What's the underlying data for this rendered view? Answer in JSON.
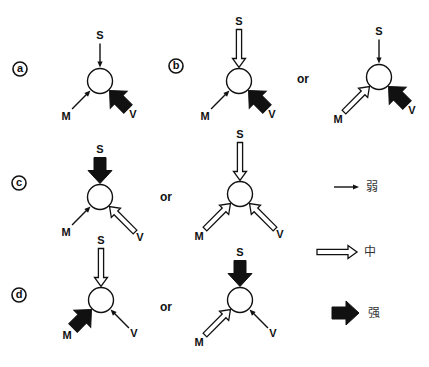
{
  "diagram": {
    "node_labels": {
      "s": "S",
      "m": "M",
      "v": "V"
    },
    "or_label": "or",
    "legend": [
      {
        "strength": "weak",
        "label": "弱",
        "style": "thin"
      },
      {
        "strength": "medium",
        "label": "中",
        "style": "hollow"
      },
      {
        "strength": "strong",
        "label": "强",
        "style": "filled"
      }
    ],
    "panels": [
      {
        "id": "a",
        "label": "a",
        "variants": [
          {
            "S": "thin",
            "M": "thin",
            "V": "filled"
          }
        ]
      },
      {
        "id": "b",
        "label": "b",
        "variants": [
          {
            "S": "hollow",
            "M": "thin",
            "V": "filled"
          },
          {
            "S": "thin",
            "M": "hollow",
            "V": "filled"
          }
        ]
      },
      {
        "id": "c",
        "label": "c",
        "variants": [
          {
            "S": "filled",
            "M": "thin",
            "V": "hollow"
          },
          {
            "S": "hollow",
            "M": "hollow",
            "V": "hollow"
          }
        ]
      },
      {
        "id": "d",
        "label": "d",
        "variants": [
          {
            "S": "hollow",
            "M": "filled",
            "V": "thin"
          },
          {
            "S": "filled",
            "M": "hollow",
            "V": "thin"
          }
        ]
      }
    ]
  }
}
